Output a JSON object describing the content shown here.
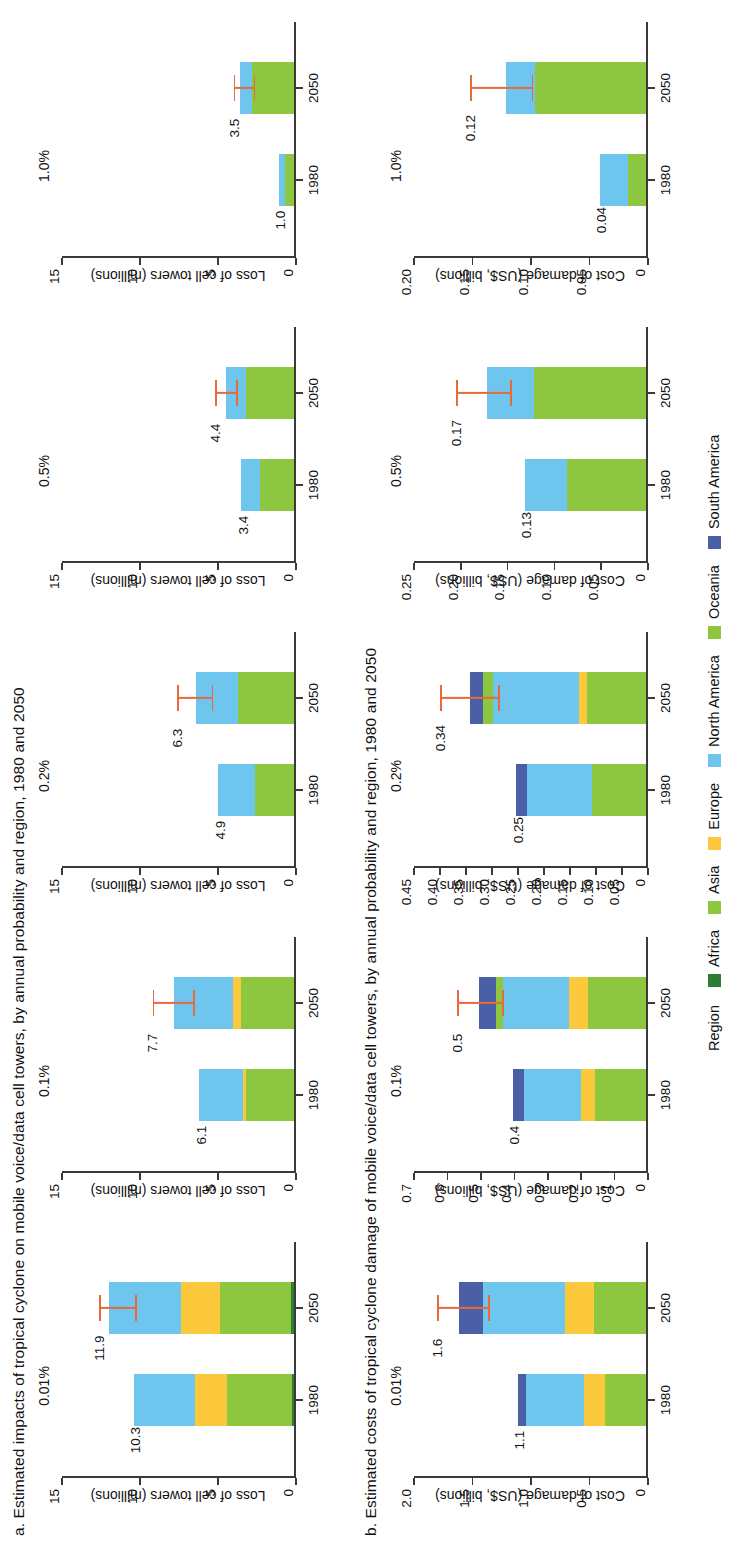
{
  "figure": {
    "panel_a_title": "a. Estimated impacts of tropical cyclone on mobile voice/data cell towers, by annual probability and region, 1980 and 2050",
    "panel_b_title": "b. Estimated costs of tropical cyclone damage of mobile voice/data cell towers, by annual probability and region, 1980 and 2050"
  },
  "legend": {
    "title": "Region",
    "items": [
      {
        "label": "Africa",
        "color": "#2e7d32"
      },
      {
        "label": "Asia",
        "color": "#8dc63f"
      },
      {
        "label": "Europe",
        "color": "#fcc93c"
      },
      {
        "label": "North America",
        "color": "#6ec6ef"
      },
      {
        "label": "Oceania",
        "color": "#8dc63f"
      },
      {
        "label": "South America",
        "color": "#4a5fa5"
      }
    ]
  },
  "chart_data": {
    "type": "bar",
    "grid": false,
    "legend_position": "bottom-center",
    "series_names": [
      "Africa",
      "Asia",
      "Europe",
      "North America",
      "Oceania",
      "South America"
    ],
    "series_colors": [
      "#2e7d32",
      "#8dc63f",
      "#fcc93c",
      "#6ec6ef",
      "#8dc63f",
      "#4a5fa5"
    ],
    "panels": [
      {
        "panel": "a",
        "ylabel": "Loss of cell towers (millions)",
        "subplots": [
          {
            "probability": "0.01%",
            "ylim": [
              0,
              15
            ],
            "yticks": [
              0,
              5,
              10,
              15
            ],
            "categories": [
              "1980",
              "2050"
            ],
            "totals": [
              "10.3",
              "11.9"
            ],
            "bars": [
              {
                "year": "1980",
                "total": 10.3,
                "stack": [
                  {
                    "region": "Africa",
                    "value": 0.15
                  },
                  {
                    "region": "Asia",
                    "value": 4.2
                  },
                  {
                    "region": "Europe",
                    "value": 2.0
                  },
                  {
                    "region": "North America",
                    "value": 3.95
                  }
                ],
                "error": null
              },
              {
                "year": "2050",
                "total": 11.9,
                "stack": [
                  {
                    "region": "Africa",
                    "value": 0.2
                  },
                  {
                    "region": "Asia",
                    "value": 4.6
                  },
                  {
                    "region": "Europe",
                    "value": 2.5
                  },
                  {
                    "region": "North America",
                    "value": 4.6
                  }
                ],
                "error": {
                  "low": 10.2,
                  "high": 12.6
                }
              }
            ]
          },
          {
            "probability": "0.1%",
            "ylim": [
              0,
              15
            ],
            "yticks": [
              0,
              5,
              10,
              15
            ],
            "categories": [
              "1980",
              "2050"
            ],
            "totals": [
              "6.1",
              "7.7"
            ],
            "bars": [
              {
                "year": "1980",
                "total": 6.1,
                "stack": [
                  {
                    "region": "Asia",
                    "value": 3.1
                  },
                  {
                    "region": "Europe",
                    "value": 0.2
                  },
                  {
                    "region": "North America",
                    "value": 2.8
                  }
                ],
                "error": null
              },
              {
                "year": "2050",
                "total": 7.7,
                "stack": [
                  {
                    "region": "Asia",
                    "value": 3.4
                  },
                  {
                    "region": "Europe",
                    "value": 0.55
                  },
                  {
                    "region": "North America",
                    "value": 3.75
                  }
                ],
                "error": {
                  "low": 6.5,
                  "high": 9.2
                }
              }
            ]
          },
          {
            "probability": "0.2%",
            "ylim": [
              0,
              15
            ],
            "yticks": [
              0,
              5,
              10,
              15
            ],
            "categories": [
              "1980",
              "2050"
            ],
            "totals": [
              "4.9",
              "6.3"
            ],
            "bars": [
              {
                "year": "1980",
                "total": 4.9,
                "stack": [
                  {
                    "region": "Asia",
                    "value": 2.5
                  },
                  {
                    "region": "North America",
                    "value": 2.4
                  }
                ],
                "error": null
              },
              {
                "year": "2050",
                "total": 6.3,
                "stack": [
                  {
                    "region": "Asia",
                    "value": 3.6
                  },
                  {
                    "region": "North America",
                    "value": 2.7
                  }
                ],
                "error": {
                  "low": 5.3,
                  "high": 7.6
                }
              }
            ]
          },
          {
            "probability": "0.5%",
            "ylim": [
              0,
              15
            ],
            "yticks": [
              0,
              5,
              10,
              15
            ],
            "categories": [
              "1980",
              "2050"
            ],
            "totals": [
              "3.4",
              "4.4"
            ],
            "bars": [
              {
                "year": "1980",
                "total": 3.4,
                "stack": [
                  {
                    "region": "Asia",
                    "value": 2.2
                  },
                  {
                    "region": "North America",
                    "value": 1.2
                  }
                ],
                "error": null
              },
              {
                "year": "2050",
                "total": 4.4,
                "stack": [
                  {
                    "region": "Asia",
                    "value": 3.1
                  },
                  {
                    "region": "North America",
                    "value": 1.3
                  }
                ],
                "error": {
                  "low": 3.7,
                  "high": 5.2
                }
              }
            ]
          },
          {
            "probability": "1.0%",
            "ylim": [
              0,
              15
            ],
            "yticks": [
              0,
              5,
              10,
              15
            ],
            "categories": [
              "1980",
              "2050"
            ],
            "totals": [
              "1.0",
              "3.5"
            ],
            "bars": [
              {
                "year": "1980",
                "total": 1.0,
                "stack": [
                  {
                    "region": "Asia",
                    "value": 0.6
                  },
                  {
                    "region": "North America",
                    "value": 0.4
                  }
                ],
                "error": null
              },
              {
                "year": "2050",
                "total": 3.5,
                "stack": [
                  {
                    "region": "Asia",
                    "value": 2.7
                  },
                  {
                    "region": "North America",
                    "value": 0.8
                  }
                ],
                "error": {
                  "low": 2.6,
                  "high": 4.0
                }
              }
            ]
          }
        ]
      },
      {
        "panel": "b",
        "ylabel": "Cost of damage (US$, billions)",
        "subplots": [
          {
            "probability": "0.01%",
            "ylim": [
              0,
              2.0
            ],
            "yticks": [
              0,
              0.5,
              1.0,
              1.5,
              2.0
            ],
            "categories": [
              "1980",
              "2050"
            ],
            "totals": [
              "1.1",
              "1.6"
            ],
            "bars": [
              {
                "year": "1980",
                "total": 1.1,
                "stack": [
                  {
                    "region": "Asia",
                    "value": 0.35
                  },
                  {
                    "region": "Europe",
                    "value": 0.18
                  },
                  {
                    "region": "North America",
                    "value": 0.5
                  },
                  {
                    "region": "South America",
                    "value": 0.07
                  }
                ],
                "error": null
              },
              {
                "year": "2050",
                "total": 1.6,
                "stack": [
                  {
                    "region": "Asia",
                    "value": 0.45
                  },
                  {
                    "region": "Europe",
                    "value": 0.25
                  },
                  {
                    "region": "North America",
                    "value": 0.7
                  },
                  {
                    "region": "South America",
                    "value": 0.2
                  }
                ],
                "error": {
                  "low": 1.35,
                  "high": 1.8
                }
              }
            ]
          },
          {
            "probability": "0.1%",
            "ylim": [
              0,
              0.7
            ],
            "yticks": [
              0,
              0.1,
              0.2,
              0.3,
              0.4,
              0.5,
              0.6,
              0.7
            ],
            "categories": [
              "1980",
              "2050"
            ],
            "totals": [
              "0.4",
              "0.5"
            ],
            "bars": [
              {
                "year": "1980",
                "total": 0.4,
                "stack": [
                  {
                    "region": "Asia",
                    "value": 0.155
                  },
                  {
                    "region": "Europe",
                    "value": 0.04
                  },
                  {
                    "region": "North America",
                    "value": 0.17
                  },
                  {
                    "region": "South America",
                    "value": 0.035
                  }
                ],
                "error": null
              },
              {
                "year": "2050",
                "total": 0.5,
                "stack": [
                  {
                    "region": "Asia",
                    "value": 0.175
                  },
                  {
                    "region": "Europe",
                    "value": 0.055
                  },
                  {
                    "region": "North America",
                    "value": 0.2
                  },
                  {
                    "region": "Oceania",
                    "value": 0.02
                  },
                  {
                    "region": "South America",
                    "value": 0.05
                  }
                ],
                "error": {
                  "low": 0.43,
                  "high": 0.57
                }
              }
            ]
          },
          {
            "probability": "0.2%",
            "ylim": [
              0,
              0.45
            ],
            "yticks": [
              0,
              0.05,
              0.1,
              0.15,
              0.2,
              0.25,
              0.3,
              0.35,
              0.4,
              0.45
            ],
            "categories": [
              "1980",
              "2050"
            ],
            "totals": [
              "0.25",
              "0.34"
            ],
            "bars": [
              {
                "year": "1980",
                "total": 0.25,
                "stack": [
                  {
                    "region": "Asia",
                    "value": 0.105
                  },
                  {
                    "region": "North America",
                    "value": 0.125
                  },
                  {
                    "region": "South America",
                    "value": 0.02
                  }
                ],
                "error": null
              },
              {
                "year": "2050",
                "total": 0.34,
                "stack": [
                  {
                    "region": "Asia",
                    "value": 0.115
                  },
                  {
                    "region": "Europe",
                    "value": 0.015
                  },
                  {
                    "region": "North America",
                    "value": 0.165
                  },
                  {
                    "region": "Oceania",
                    "value": 0.02
                  },
                  {
                    "region": "South America",
                    "value": 0.025
                  }
                ],
                "error": {
                  "low": 0.285,
                  "high": 0.4
                }
              }
            ]
          },
          {
            "probability": "0.5%",
            "ylim": [
              0,
              0.25
            ],
            "yticks": [
              0,
              0.05,
              0.1,
              0.15,
              0.2,
              0.25
            ],
            "categories": [
              "1980",
              "2050"
            ],
            "totals": [
              "0.13",
              "0.17"
            ],
            "bars": [
              {
                "year": "1980",
                "total": 0.13,
                "stack": [
                  {
                    "region": "Asia",
                    "value": 0.085
                  },
                  {
                    "region": "North America",
                    "value": 0.045
                  }
                ],
                "error": null
              },
              {
                "year": "2050",
                "total": 0.17,
                "stack": [
                  {
                    "region": "Asia",
                    "value": 0.12
                  },
                  {
                    "region": "North America",
                    "value": 0.05
                  }
                ],
                "error": {
                  "low": 0.145,
                  "high": 0.205
                }
              }
            ]
          },
          {
            "probability": "1.0%",
            "ylim": [
              0,
              0.2
            ],
            "yticks": [
              0,
              0.05,
              0.1,
              0.15,
              0.2
            ],
            "categories": [
              "1980",
              "2050"
            ],
            "totals": [
              "0.04",
              "0.12"
            ],
            "bars": [
              {
                "year": "1980",
                "total": 0.04,
                "stack": [
                  {
                    "region": "Asia",
                    "value": 0.016
                  },
                  {
                    "region": "North America",
                    "value": 0.024
                  }
                ],
                "error": null
              },
              {
                "year": "2050",
                "total": 0.12,
                "stack": [
                  {
                    "region": "Asia",
                    "value": 0.095
                  },
                  {
                    "region": "North America",
                    "value": 0.025
                  }
                ],
                "error": {
                  "low": 0.098,
                  "high": 0.152
                }
              }
            ]
          }
        ]
      }
    ]
  }
}
